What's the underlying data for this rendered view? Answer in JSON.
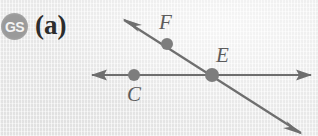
{
  "figure": {
    "badge": {
      "text": "GS",
      "color": "#9a9a9a",
      "text_color": "#f4f4f4"
    },
    "part_label": "(a)",
    "background_color": "#efefef",
    "ink_color": "#6e6e6e",
    "label_color": "#5c5c5c",
    "canvas": {
      "width": 318,
      "height": 136
    }
  },
  "geometry": {
    "points": [
      {
        "name": "F",
        "label": "F",
        "x": 167,
        "y": 44,
        "radius": 6,
        "label_x": 159,
        "label_y": 12
      },
      {
        "name": "E",
        "label": "E",
        "x": 212,
        "y": 75,
        "radius": 7,
        "label_x": 216,
        "label_y": 45
      },
      {
        "name": "C",
        "label": "C",
        "x": 134,
        "y": 75,
        "radius": 6,
        "label_x": 127,
        "label_y": 84
      }
    ],
    "lines": [
      {
        "name": "horizontal-line",
        "x1": 92,
        "y1": 75,
        "x2": 311,
        "y2": 75,
        "arrow_start": true,
        "arrow_end": true
      },
      {
        "name": "diagonal-line",
        "x1": 124,
        "y1": 20,
        "x2": 301,
        "y2": 133,
        "arrow_start": true,
        "arrow_end": true
      }
    ]
  }
}
